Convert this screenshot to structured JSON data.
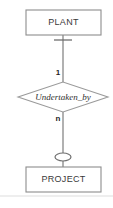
{
  "diagram": {
    "type": "entity-relationship-diagram",
    "notation": "Chen",
    "canvas": {
      "width": 113,
      "height": 208,
      "background": "#ffffff"
    },
    "stroke_color": "#7d7d7d",
    "text_color": "#3a3a3a",
    "entities": [
      {
        "id": "plant",
        "label": "PLANT",
        "shape": "rectangle",
        "x": 26,
        "y": 10,
        "width": 75,
        "height": 25
      },
      {
        "id": "project",
        "label": "PROJECT",
        "shape": "rectangle",
        "x": 26,
        "y": 167,
        "width": 75,
        "height": 25
      }
    ],
    "relationship": {
      "id": "undertaken_by",
      "label": "Undertaken_by",
      "shape": "diamond",
      "style": "italic",
      "cx": 63,
      "cy": 97,
      "rx": 45,
      "ry": 15
    },
    "connections": [
      {
        "id": "plant-to-relationship",
        "from": "plant",
        "to": "undertaken_by",
        "cardinality": "1",
        "cardinality_x": 58,
        "cardinality_y": 73,
        "end_symbol": "crossbar",
        "symbol_name": "mandatory-one-bar",
        "symbol_y": 40
      },
      {
        "id": "relationship-to-project",
        "from": "undertaken_by",
        "to": "project",
        "cardinality": "n",
        "cardinality_x": 58,
        "cardinality_y": 119,
        "end_symbol": "ellipse",
        "symbol_name": "optional-participation-oval",
        "symbol_y": 157
      }
    ],
    "footer_rule": {
      "y": 196,
      "x1": 0,
      "x2": 113,
      "color": "#dddddd"
    }
  }
}
